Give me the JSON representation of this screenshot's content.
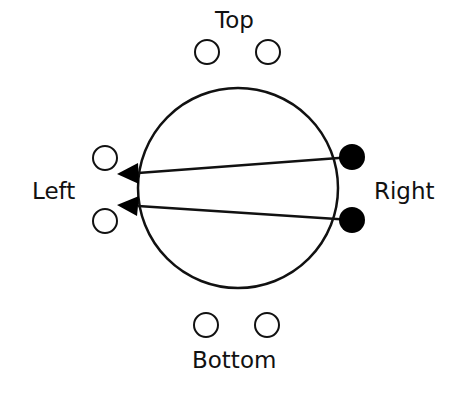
{
  "diagram": {
    "labels": {
      "top": "Top",
      "left": "Left",
      "right": "Right",
      "bottom": "Bottom"
    },
    "main_circle": {
      "cx": 238,
      "cy": 188,
      "r": 100
    },
    "ports": [
      {
        "name": "top-1",
        "cx": 207,
        "cy": 52,
        "filled": false
      },
      {
        "name": "top-2",
        "cx": 268,
        "cy": 52,
        "filled": false
      },
      {
        "name": "left-1",
        "cx": 105,
        "cy": 158,
        "filled": false
      },
      {
        "name": "left-2",
        "cx": 105,
        "cy": 221,
        "filled": false
      },
      {
        "name": "right-1",
        "cx": 352,
        "cy": 157,
        "filled": true
      },
      {
        "name": "right-2",
        "cx": 352,
        "cy": 220,
        "filled": true
      },
      {
        "name": "bottom-1",
        "cx": 206,
        "cy": 325,
        "filled": false
      },
      {
        "name": "bottom-2",
        "cx": 267,
        "cy": 325,
        "filled": false
      }
    ],
    "arrows": [
      {
        "from": "right-1",
        "to": "left-1"
      },
      {
        "from": "right-2",
        "to": "left-2"
      }
    ],
    "colors": {
      "stroke": "#111111",
      "fill": "#000000",
      "background": "#ffffff"
    }
  }
}
